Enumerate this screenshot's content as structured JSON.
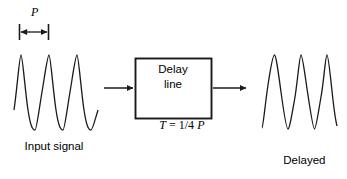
{
  "figure": {
    "type": "block-diagram",
    "background_color": "#ffffff",
    "stroke_color": "#1a1a1a",
    "period_marker": {
      "label": "P",
      "label_style": "italic-serif",
      "span_start_x": 19,
      "span_end_x": 49,
      "baseline_y": 32
    },
    "input": {
      "caption": "Input signal",
      "waveform": {
        "type": "sine",
        "cycles": 3,
        "phase": "starts at zero rising",
        "x_start": 14,
        "x_end": 98,
        "baseline_y": 92,
        "amplitude": 38,
        "period_px": 28
      }
    },
    "block": {
      "line1": "Delay",
      "line2": "line",
      "formula_parts": {
        "symbol": "T",
        "operator": " = ",
        "value": "1/4",
        "unit": "P"
      },
      "formula_text": "T = 1/4 P",
      "rect": {
        "x": 135,
        "y": 58,
        "width": 76,
        "height": 60
      }
    },
    "arrows": {
      "input_arrow": {
        "x1": 104,
        "y1": 88,
        "x2": 133,
        "y2": 88,
        "direction": "right"
      },
      "output_arrow": {
        "x1": 213,
        "y1": 88,
        "x2": 246,
        "y2": 88,
        "direction": "right"
      }
    },
    "output": {
      "caption_line1": "Delayed",
      "caption_line2": "output signal",
      "waveform": {
        "type": "sine",
        "cycles": 3,
        "phase": "delayed by 1/4 period",
        "x_start": 262,
        "x_end": 337,
        "baseline_y": 92,
        "amplitude": 38,
        "period_px": 25
      }
    }
  },
  "icons": {
    "arrowhead": "triangle-right",
    "tick": "vertical-bar"
  }
}
